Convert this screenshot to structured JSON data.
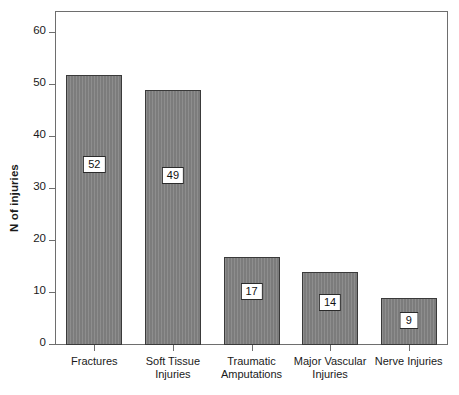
{
  "chart_data": {
    "type": "bar",
    "title": "",
    "xlabel": "",
    "ylabel": "N of injuries",
    "ylim": [
      0,
      63
    ],
    "yticks": [
      0,
      10,
      20,
      30,
      40,
      50,
      60
    ],
    "ytick_labels": [
      "0",
      "10",
      "20",
      "30",
      "40",
      "50",
      "60"
    ],
    "grid": false,
    "legend": "none",
    "bar_color": "#838383",
    "bar_edge_color": "#3a3a3a",
    "frame_color": "#6e6e6e",
    "categories": [
      "Fractures",
      "Soft Tissue Injuries",
      "Traumatic Amputations",
      "Major Vascular Injuries",
      "Nerve Injuries"
    ],
    "category_lines": [
      [
        "Fractures",
        ""
      ],
      [
        "Soft Tissue",
        "Injuries"
      ],
      [
        "Traumatic",
        "Amputations"
      ],
      [
        "Major Vascular",
        "Injuries"
      ],
      [
        "Nerve Injuries",
        ""
      ]
    ],
    "values": [
      52,
      49,
      17,
      14,
      9
    ],
    "value_labels": [
      "52",
      "49",
      "17",
      "14",
      "9"
    ]
  }
}
